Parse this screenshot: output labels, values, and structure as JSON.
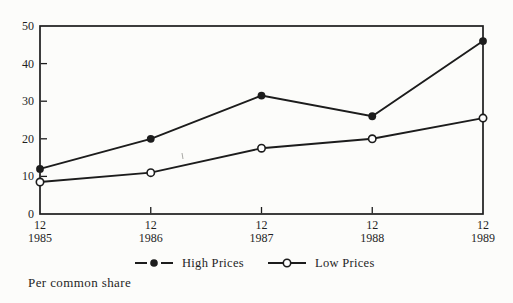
{
  "chart_data": {
    "type": "line",
    "title": "",
    "xlabel": "",
    "ylabel": "",
    "x_ticks": [
      {
        "month": "12",
        "year": "1985"
      },
      {
        "month": "12",
        "year": "1986"
      },
      {
        "month": "12",
        "year": "1987"
      },
      {
        "month": "12",
        "year": "1988"
      },
      {
        "month": "12",
        "year": "1989"
      }
    ],
    "series": [
      {
        "name": "High Prices",
        "marker": "filled-circle",
        "values": [
          12,
          20,
          31.5,
          26,
          46
        ]
      },
      {
        "name": "Low Prices",
        "marker": "open-circle",
        "values": [
          8.5,
          11,
          17.5,
          20,
          25.5
        ]
      }
    ],
    "ylim": [
      0,
      50
    ],
    "yticks": [
      "0",
      "10",
      "20",
      "30",
      "40",
      "50"
    ],
    "grid": false,
    "legend_position": "bottom-center",
    "footnote": "Per common share",
    "colors": {
      "line": "#1c1c1c",
      "text": "#1f1f1f",
      "background": "#fcfcfa",
      "open_marker_fill": "#ffffff"
    }
  }
}
